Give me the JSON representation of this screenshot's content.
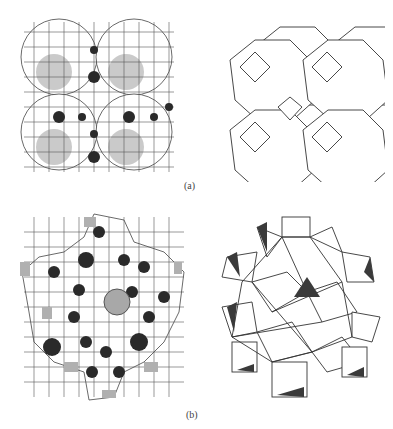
{
  "figure": {
    "panels": [
      {
        "id": "a",
        "label": "(a)",
        "left_title": "framework with oxygen rings",
        "right_title": "cage polyhedra (truncated octahedra)"
      },
      {
        "id": "b",
        "label": "(b)",
        "left_title": "ring framework",
        "right_title": "polyhedral representation"
      }
    ]
  },
  "colors": {
    "line": "#333333",
    "shade_light": "#aaaaaa",
    "shade_dark": "#2a2a2a",
    "background": "#ffffff"
  }
}
